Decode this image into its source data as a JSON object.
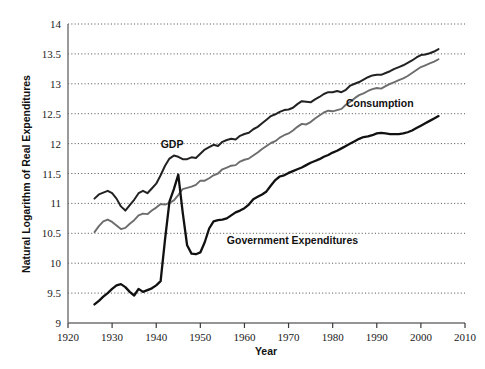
{
  "chart_data": {
    "type": "line",
    "title": "",
    "xlabel": "Year",
    "ylabel": "Natural Logarithm of Real Expenditures",
    "xlim": [
      1920,
      2010
    ],
    "ylim": [
      9,
      14
    ],
    "xticks": [
      1920,
      1930,
      1940,
      1950,
      1960,
      1970,
      1980,
      1990,
      2000,
      2010
    ],
    "yticks": [
      9,
      9.5,
      10,
      10.5,
      11,
      11.5,
      12,
      12.5,
      13,
      13.5,
      14
    ],
    "xtick_labels": [
      "1920",
      "1930",
      "1940",
      "1950",
      "1960",
      "1970",
      "1980",
      "1990",
      "2000",
      "2010"
    ],
    "ytick_labels": [
      "9",
      "9.5",
      "10",
      "10.5",
      "11",
      "11.5",
      "12",
      "12.5",
      "13",
      "13.5",
      "14"
    ],
    "grid": "horizontal-dotted",
    "legend": "inline-annotations",
    "series": [
      {
        "name": "GDP",
        "color": "#222222",
        "width": 2.0,
        "label_x": 1941,
        "label_y": 11.93,
        "x": [
          1926,
          1927,
          1928,
          1929,
          1930,
          1931,
          1932,
          1933,
          1934,
          1935,
          1936,
          1937,
          1938,
          1939,
          1940,
          1941,
          1942,
          1943,
          1944,
          1945,
          1946,
          1947,
          1948,
          1949,
          1950,
          1951,
          1952,
          1953,
          1954,
          1955,
          1956,
          1957,
          1958,
          1959,
          1960,
          1961,
          1962,
          1963,
          1964,
          1965,
          1966,
          1967,
          1968,
          1969,
          1970,
          1971,
          1972,
          1973,
          1974,
          1975,
          1976,
          1977,
          1978,
          1979,
          1980,
          1981,
          1982,
          1983,
          1984,
          1985,
          1986,
          1987,
          1988,
          1989,
          1990,
          1991,
          1992,
          1993,
          1994,
          1995,
          1996,
          1997,
          1998,
          1999,
          2000,
          2001,
          2002,
          2003,
          2004
        ],
        "y": [
          11.08,
          11.15,
          11.18,
          11.21,
          11.17,
          11.08,
          10.95,
          10.88,
          10.97,
          11.06,
          11.17,
          11.21,
          11.17,
          11.25,
          11.33,
          11.47,
          11.63,
          11.75,
          11.8,
          11.78,
          11.74,
          11.74,
          11.77,
          11.76,
          11.83,
          11.9,
          11.94,
          11.98,
          11.96,
          12.03,
          12.06,
          12.08,
          12.07,
          12.13,
          12.16,
          12.18,
          12.24,
          12.28,
          12.34,
          12.4,
          12.46,
          12.49,
          12.53,
          12.56,
          12.57,
          12.6,
          12.66,
          12.71,
          12.7,
          12.69,
          12.74,
          12.78,
          12.83,
          12.86,
          12.86,
          12.88,
          12.86,
          12.9,
          12.97,
          13.0,
          13.03,
          13.07,
          13.11,
          13.14,
          13.15,
          13.15,
          13.18,
          13.21,
          13.25,
          13.28,
          13.31,
          13.35,
          13.39,
          13.44,
          13.48,
          13.49,
          13.51,
          13.54,
          13.58
        ]
      },
      {
        "name": "Consumption",
        "color": "#6d6d6d",
        "width": 1.9,
        "label_x": 1983,
        "label_y": 12.62,
        "x": [
          1926,
          1927,
          1928,
          1929,
          1930,
          1931,
          1932,
          1933,
          1934,
          1935,
          1936,
          1937,
          1938,
          1939,
          1940,
          1941,
          1942,
          1943,
          1944,
          1945,
          1946,
          1947,
          1948,
          1949,
          1950,
          1951,
          1952,
          1953,
          1954,
          1955,
          1956,
          1957,
          1958,
          1959,
          1960,
          1961,
          1962,
          1963,
          1964,
          1965,
          1966,
          1967,
          1968,
          1969,
          1970,
          1971,
          1972,
          1973,
          1974,
          1975,
          1976,
          1977,
          1978,
          1979,
          1980,
          1981,
          1982,
          1983,
          1984,
          1985,
          1986,
          1987,
          1988,
          1989,
          1990,
          1991,
          1992,
          1993,
          1994,
          1995,
          1996,
          1997,
          1998,
          1999,
          2000,
          2001,
          2002,
          2003,
          2004
        ],
        "y": [
          10.52,
          10.62,
          10.7,
          10.73,
          10.69,
          10.63,
          10.57,
          10.59,
          10.66,
          10.72,
          10.8,
          10.83,
          10.82,
          10.88,
          10.93,
          10.99,
          10.98,
          11.01,
          11.05,
          11.14,
          11.24,
          11.26,
          11.28,
          11.31,
          11.38,
          11.38,
          11.42,
          11.47,
          11.5,
          11.57,
          11.6,
          11.63,
          11.64,
          11.7,
          11.73,
          11.75,
          11.8,
          11.85,
          11.91,
          11.96,
          12.01,
          12.04,
          12.1,
          12.14,
          12.17,
          12.22,
          12.28,
          12.33,
          12.32,
          12.36,
          12.42,
          12.47,
          12.52,
          12.55,
          12.54,
          12.56,
          12.58,
          12.65,
          12.7,
          12.76,
          12.81,
          12.84,
          12.88,
          12.91,
          12.93,
          12.92,
          12.96,
          13.0,
          13.03,
          13.06,
          13.09,
          13.13,
          13.18,
          13.23,
          13.28,
          13.31,
          13.34,
          13.37,
          13.41
        ]
      },
      {
        "name": "Government Expenditures",
        "color": "#111111",
        "width": 2.3,
        "label_x": 1956,
        "label_y": 10.32,
        "x": [
          1926,
          1927,
          1928,
          1929,
          1930,
          1931,
          1932,
          1933,
          1934,
          1935,
          1936,
          1937,
          1938,
          1939,
          1940,
          1941,
          1942,
          1943,
          1944,
          1945,
          1946,
          1947,
          1948,
          1949,
          1950,
          1951,
          1952,
          1953,
          1954,
          1955,
          1956,
          1957,
          1958,
          1959,
          1960,
          1961,
          1962,
          1963,
          1964,
          1965,
          1966,
          1967,
          1968,
          1969,
          1970,
          1971,
          1972,
          1973,
          1974,
          1975,
          1976,
          1977,
          1978,
          1979,
          1980,
          1981,
          1982,
          1983,
          1984,
          1985,
          1986,
          1987,
          1988,
          1989,
          1990,
          1991,
          1992,
          1993,
          1994,
          1995,
          1996,
          1997,
          1998,
          1999,
          2000,
          2001,
          2002,
          2003,
          2004
        ],
        "y": [
          9.31,
          9.37,
          9.44,
          9.5,
          9.57,
          9.63,
          9.65,
          9.6,
          9.52,
          9.46,
          9.57,
          9.52,
          9.55,
          9.58,
          9.63,
          9.7,
          10.4,
          11.03,
          11.24,
          11.48,
          10.85,
          10.3,
          10.16,
          10.15,
          10.18,
          10.35,
          10.58,
          10.7,
          10.72,
          10.73,
          10.75,
          10.8,
          10.85,
          10.88,
          10.92,
          10.98,
          11.07,
          11.11,
          11.15,
          11.2,
          11.3,
          11.39,
          11.45,
          11.47,
          11.51,
          11.54,
          11.57,
          11.6,
          11.64,
          11.68,
          11.71,
          11.74,
          11.78,
          11.81,
          11.85,
          11.88,
          11.92,
          11.96,
          12.0,
          12.04,
          12.08,
          12.11,
          12.12,
          12.14,
          12.17,
          12.18,
          12.17,
          12.16,
          12.16,
          12.16,
          12.17,
          12.19,
          12.22,
          12.26,
          12.3,
          12.34,
          12.38,
          12.42,
          12.46
        ]
      }
    ]
  },
  "axes": {
    "x_axis_title": "Year",
    "y_axis_title": "Natural Logarithm of Real Expenditures"
  }
}
